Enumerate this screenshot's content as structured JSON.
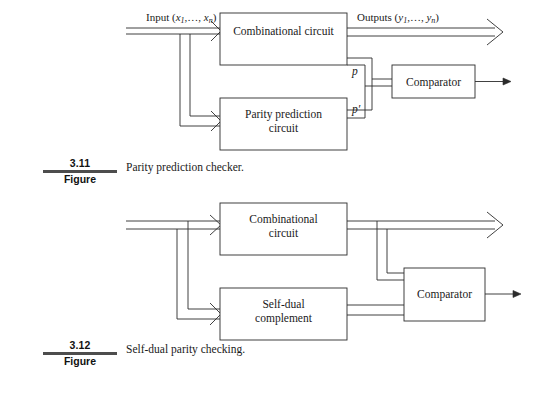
{
  "page": {
    "background": "#ffffff",
    "line_color": "#2b2b2b",
    "text_color": "#1a1a1a",
    "rule_color": "#4d4d4d",
    "width": 542,
    "height": 395
  },
  "figures": [
    {
      "id": "figure-3-11",
      "number": "3.11",
      "word": "Figure",
      "caption": "Parity prediction checker.",
      "blocks": [
        {
          "id": "combinational-circuit",
          "line1": "Combinational circuit",
          "line2": ""
        },
        {
          "id": "parity-prediction-circuit",
          "line1": "Parity prediction",
          "line2": "circuit"
        },
        {
          "id": "comparator",
          "line1": "Comparator",
          "line2": ""
        }
      ],
      "labels": {
        "input": "Input (x1,…, xn)",
        "input_plain": "Input (",
        "input_var": "x",
        "input_sub1": "1",
        "input_mid": ",…, ",
        "input_var2": "x",
        "input_sub2": "n",
        "input_close": ")",
        "outputs_plain": "Outputs (",
        "outputs_var": "y",
        "outputs_sub1": "1",
        "outputs_mid": ",…, ",
        "outputs_var2": "y",
        "outputs_sub2": "n",
        "outputs_close": ")",
        "signal_p": "p",
        "signal_p_prime": "p′"
      }
    },
    {
      "id": "figure-3-12",
      "number": "3.12",
      "word": "Figure",
      "caption": "Self-dual parity checking.",
      "blocks": [
        {
          "id": "combinational-circuit",
          "line1": "Combinational",
          "line2": "circuit"
        },
        {
          "id": "self-dual-complement",
          "line1": "Self-dual",
          "line2": "complement"
        },
        {
          "id": "comparator",
          "line1": "Comparator",
          "line2": ""
        }
      ],
      "labels": {}
    }
  ]
}
